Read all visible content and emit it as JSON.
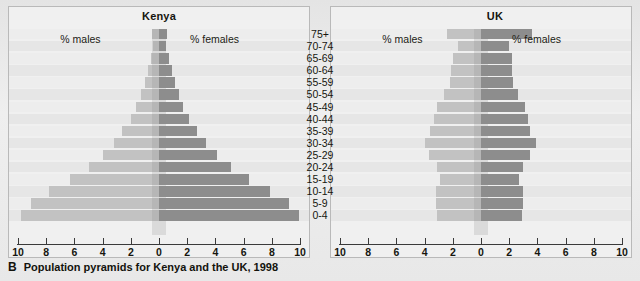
{
  "caption": {
    "tag": "B",
    "text": "Population pyramids for Kenya and the UK, 1998"
  },
  "legend": {
    "males": "% males",
    "females": "% females"
  },
  "chart_data": {
    "type": "bar",
    "subtype": "population-pyramid",
    "title": "Population pyramids for Kenya and the UK, 1998",
    "xlabel": "",
    "ylabel": "",
    "xlim": [
      -10,
      10
    ],
    "grid": false,
    "legend_position": "inside-top",
    "tick_labels": [
      "10",
      "8",
      "6",
      "4",
      "2",
      "0",
      "2",
      "4",
      "6",
      "8",
      "10"
    ],
    "tick_values": [
      -10,
      -8,
      -6,
      -4,
      -2,
      0,
      2,
      4,
      6,
      8,
      10
    ],
    "categories": [
      "75+",
      "70-74",
      "65-69",
      "60-64",
      "55-59",
      "50-54",
      "45-49",
      "40-44",
      "35-39",
      "30-34",
      "25-29",
      "20-24",
      "15-19",
      "10-14",
      "5-9",
      "0-4"
    ],
    "panels": [
      {
        "name": "Kenya",
        "series": [
          {
            "name": "% males",
            "values": [
              0.5,
              0.4,
              0.6,
              0.8,
              1.0,
              1.3,
              1.6,
              2.0,
              2.6,
              3.2,
              4.0,
              5.0,
              6.3,
              7.8,
              9.1,
              9.8
            ]
          },
          {
            "name": "% females",
            "values": [
              0.6,
              0.5,
              0.7,
              0.9,
              1.1,
              1.4,
              1.7,
              2.1,
              2.7,
              3.3,
              4.1,
              5.1,
              6.4,
              7.9,
              9.2,
              9.9
            ]
          }
        ]
      },
      {
        "name": "UK",
        "series": [
          {
            "name": "% males",
            "values": [
              2.4,
              1.6,
              2.0,
              2.1,
              2.2,
              2.6,
              3.1,
              3.3,
              3.6,
              4.0,
              3.7,
              3.1,
              2.9,
              3.2,
              3.2,
              3.1
            ]
          },
          {
            "name": "% females",
            "values": [
              3.6,
              2.0,
              2.2,
              2.2,
              2.3,
              2.6,
              3.1,
              3.3,
              3.5,
              3.9,
              3.5,
              3.0,
              2.7,
              3.0,
              3.0,
              2.9
            ]
          }
        ]
      }
    ]
  }
}
